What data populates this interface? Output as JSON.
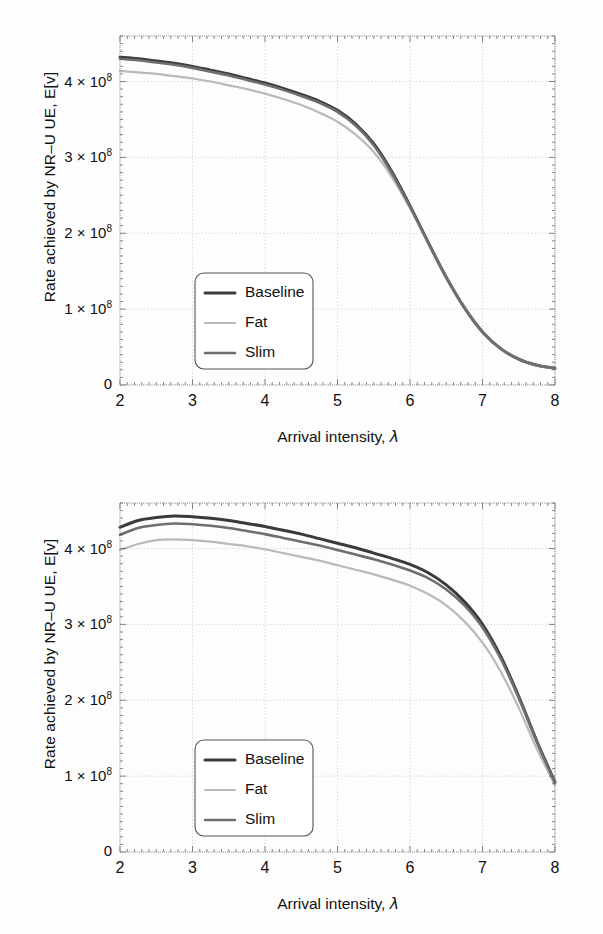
{
  "figure": {
    "caption_none": "",
    "panels": [
      {
        "id": "top",
        "name": "upper-panel"
      },
      {
        "id": "bottom",
        "name": "lower-panel"
      }
    ]
  },
  "axes": {
    "xlabel_text": "Arrival intensity, ",
    "xlabel_symbol": "λ",
    "ylabel": "Rate achieved by NR–U UE, E[v]",
    "xticks": [
      "2",
      "3",
      "4",
      "5",
      "6",
      "7",
      "8"
    ],
    "yticks": [
      "0",
      "1 × 10",
      "2 × 10",
      "3 × 10",
      "4 × 10"
    ],
    "yticks_full": [
      "0",
      "1 × 10⁸",
      "2 × 10⁸",
      "3 × 10⁸",
      "4 × 10⁸"
    ],
    "yexp": "8"
  },
  "legend": {
    "entries": [
      {
        "label": "Baseline",
        "color": "#3a3a3a",
        "width": 3.0
      },
      {
        "label": "Fat",
        "color": "#b9b9b9",
        "width": 2.2
      },
      {
        "label": "Slim",
        "color": "#6e6e6e",
        "width": 2.6
      }
    ]
  },
  "colors": {
    "frame": "#6f6f6f",
    "grid": "#c9c9c9",
    "text": "#111111",
    "background": "#ffffff",
    "legend_border": "#555555"
  },
  "chart_data": [
    {
      "type": "line",
      "title": "",
      "panel": "top",
      "xlabel": "Arrival intensity, λ",
      "ylabel": "Rate achieved by NR–U UE, E[v]",
      "xlim": [
        2,
        8
      ],
      "ylim": [
        0,
        460000000
      ],
      "xticks": [
        2,
        3,
        4,
        5,
        6,
        7,
        8
      ],
      "yticks": [
        0,
        100000000,
        200000000,
        300000000,
        400000000
      ],
      "grid": true,
      "legend_position": "lower-left-inside",
      "x": [
        2.0,
        2.25,
        2.5,
        2.75,
        3.0,
        3.25,
        3.5,
        3.75,
        4.0,
        4.25,
        4.5,
        4.75,
        5.0,
        5.25,
        5.5,
        5.75,
        6.0,
        6.25,
        6.5,
        6.75,
        7.0,
        7.25,
        7.5,
        7.75,
        8.0
      ],
      "series": [
        {
          "name": "Baseline",
          "values": [
            432000000,
            430000000,
            427000000,
            424000000,
            420000000,
            415000000,
            410000000,
            404000000,
            398000000,
            391000000,
            383000000,
            374000000,
            362000000,
            344000000,
            318000000,
            281000000,
            236000000,
            188000000,
            142000000,
            102000000,
            70000000,
            48000000,
            34000000,
            26000000,
            22000000
          ]
        },
        {
          "name": "Fat",
          "values": [
            414000000,
            412000000,
            410000000,
            407000000,
            404000000,
            400000000,
            395000000,
            390000000,
            384000000,
            377000000,
            369000000,
            359000000,
            347000000,
            330000000,
            307000000,
            274000000,
            233000000,
            187000000,
            142000000,
            102000000,
            70000000,
            48000000,
            34000000,
            26000000,
            22000000
          ]
        },
        {
          "name": "Slim",
          "values": [
            430000000,
            428000000,
            425000000,
            422000000,
            418000000,
            413000000,
            408000000,
            402000000,
            396000000,
            389000000,
            381000000,
            372000000,
            360000000,
            342000000,
            316000000,
            279000000,
            235000000,
            188000000,
            142000000,
            102000000,
            70000000,
            48000000,
            34000000,
            26000000,
            22000000
          ]
        }
      ]
    },
    {
      "type": "line",
      "title": "",
      "panel": "bottom",
      "xlabel": "Arrival intensity, λ",
      "ylabel": "Rate achieved by NR–U UE, E[v]",
      "xlim": [
        2,
        8
      ],
      "ylim": [
        0,
        460000000
      ],
      "xticks": [
        2,
        3,
        4,
        5,
        6,
        7,
        8
      ],
      "yticks": [
        0,
        100000000,
        200000000,
        300000000,
        400000000
      ],
      "grid": true,
      "legend_position": "lower-left-inside",
      "x": [
        2.0,
        2.25,
        2.5,
        2.75,
        3.0,
        3.25,
        3.5,
        3.75,
        4.0,
        4.25,
        4.5,
        4.75,
        5.0,
        5.25,
        5.5,
        5.75,
        6.0,
        6.25,
        6.5,
        6.75,
        7.0,
        7.25,
        7.5,
        7.75,
        8.0
      ],
      "series": [
        {
          "name": "Baseline",
          "values": [
            428000000,
            437000000,
            441000000,
            443000000,
            442000000,
            440000000,
            437000000,
            433000000,
            429000000,
            424000000,
            419000000,
            413000000,
            407000000,
            401000000,
            394000000,
            387000000,
            379000000,
            368000000,
            352000000,
            330000000,
            300000000,
            258000000,
            205000000,
            146000000,
            92000000
          ]
        },
        {
          "name": "Fat",
          "values": [
            398000000,
            406000000,
            411000000,
            412000000,
            411000000,
            409000000,
            406000000,
            403000000,
            399000000,
            394000000,
            389000000,
            384000000,
            378000000,
            372000000,
            366000000,
            359000000,
            351000000,
            340000000,
            325000000,
            304000000,
            276000000,
            238000000,
            190000000,
            136000000,
            88000000
          ]
        },
        {
          "name": "Slim",
          "values": [
            418000000,
            427000000,
            431000000,
            433000000,
            432000000,
            430000000,
            427000000,
            423000000,
            419000000,
            414000000,
            409000000,
            404000000,
            398000000,
            392000000,
            386000000,
            379000000,
            371000000,
            361000000,
            346000000,
            325000000,
            296000000,
            255000000,
            203000000,
            145000000,
            91000000
          ]
        }
      ]
    }
  ]
}
